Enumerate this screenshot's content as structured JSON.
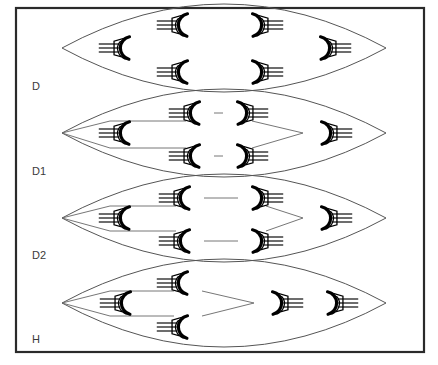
{
  "figure": {
    "title": "",
    "background": "#ffffff",
    "frame": {
      "x": 16,
      "y": 8,
      "width": 408,
      "height": 344,
      "stroke": "#2a2a2a"
    },
    "colors": {
      "frame": "#2a2a2a",
      "lens": "#555555",
      "link": "#666666",
      "node_outline": "#000000",
      "node_fill": "#ffffff",
      "label": "#3a3a3a"
    }
  },
  "rows": [
    {
      "id": "row-d",
      "label": "D",
      "label_x": 32,
      "label_y": 90,
      "lens": {
        "cx": 224,
        "cy": 48,
        "half_width": 162,
        "half_height": 44
      },
      "nodes": [
        {
          "name": "node-d-left",
          "x": 130,
          "y": 48,
          "dir": "left"
        },
        {
          "name": "node-d-upper-inner",
          "x": 188,
          "y": 25,
          "dir": "left"
        },
        {
          "name": "node-d-upper-outer",
          "x": 252,
          "y": 25,
          "dir": "right"
        },
        {
          "name": "node-d-right",
          "x": 320,
          "y": 48,
          "dir": "right"
        },
        {
          "name": "node-d-lower-inner",
          "x": 188,
          "y": 72,
          "dir": "left"
        },
        {
          "name": "node-d-lower-outer",
          "x": 252,
          "y": 72,
          "dir": "right"
        }
      ],
      "links": []
    },
    {
      "id": "row-d1",
      "label": "D1",
      "label_x": 32,
      "label_y": 175,
      "lens": {
        "cx": 224,
        "cy": 133,
        "half_width": 162,
        "half_height": 44
      },
      "nodes": [
        {
          "name": "node-d1-left",
          "x": 130,
          "y": 133,
          "dir": "left"
        },
        {
          "name": "node-d1-upper-inner",
          "x": 200,
          "y": 113,
          "dir": "left"
        },
        {
          "name": "node-d1-upper-outer",
          "x": 237,
          "y": 113,
          "dir": "right"
        },
        {
          "name": "node-d1-lower-inner",
          "x": 200,
          "y": 156,
          "dir": "left"
        },
        {
          "name": "node-d1-lower-outer",
          "x": 237,
          "y": 156,
          "dir": "right"
        },
        {
          "name": "node-d1-right",
          "x": 321,
          "y": 133,
          "dir": "right"
        }
      ],
      "links": [
        {
          "name": "link-d1-upper-apex",
          "points": "62,133 110,121 186,121"
        },
        {
          "name": "link-d1-lower-apex",
          "points": "62,133 110,148 186,148"
        },
        {
          "name": "link-d1-upper-right",
          "points": "252,121 303,133"
        },
        {
          "name": "link-d1-lower-right",
          "points": "252,148 303,133"
        },
        {
          "name": "link-d1-pair-upper",
          "points": "214,113 223,113"
        },
        {
          "name": "link-d1-pair-lower",
          "points": "214,156 223,156"
        }
      ]
    },
    {
      "id": "row-d2",
      "label": "D2",
      "label_x": 32,
      "label_y": 259,
      "lens": {
        "cx": 224,
        "cy": 218,
        "half_width": 162,
        "half_height": 44
      },
      "nodes": [
        {
          "name": "node-d2-left",
          "x": 130,
          "y": 218,
          "dir": "left"
        },
        {
          "name": "node-d2-upper-inner",
          "x": 190,
          "y": 198,
          "dir": "left"
        },
        {
          "name": "node-d2-upper-outer",
          "x": 252,
          "y": 198,
          "dir": "right"
        },
        {
          "name": "node-d2-lower-inner",
          "x": 190,
          "y": 241,
          "dir": "left"
        },
        {
          "name": "node-d2-lower-outer",
          "x": 252,
          "y": 241,
          "dir": "right"
        },
        {
          "name": "node-d2-right",
          "x": 321,
          "y": 218,
          "dir": "right"
        }
      ],
      "links": [
        {
          "name": "link-d2-upper-apex",
          "points": "62,218 110,206 176,206"
        },
        {
          "name": "link-d2-lower-apex",
          "points": "62,218 110,231 176,231"
        },
        {
          "name": "link-d2-pair-upper",
          "points": "204,198 238,198"
        },
        {
          "name": "link-d2-pair-lower",
          "points": "204,241 238,241"
        },
        {
          "name": "link-d2-upper-right",
          "points": "266,206 303,218"
        },
        {
          "name": "link-d2-lower-right",
          "points": "266,231 303,218"
        }
      ]
    },
    {
      "id": "row-h",
      "label": "H",
      "label_x": 32,
      "label_y": 343,
      "lens": {
        "cx": 224,
        "cy": 303,
        "half_width": 162,
        "half_height": 44
      },
      "nodes": [
        {
          "name": "node-h-left",
          "x": 131,
          "y": 303,
          "dir": "left"
        },
        {
          "name": "node-h-upper",
          "x": 188,
          "y": 283,
          "dir": "left"
        },
        {
          "name": "node-h-lower",
          "x": 188,
          "y": 327,
          "dir": "left"
        },
        {
          "name": "node-h-middle",
          "x": 272,
          "y": 303,
          "dir": "right"
        },
        {
          "name": "node-h-right",
          "x": 327,
          "y": 303,
          "dir": "right"
        }
      ],
      "links": [
        {
          "name": "link-h-upper-apex",
          "points": "62,303 110,291 174,291"
        },
        {
          "name": "link-h-lower-apex",
          "points": "62,303 110,316 174,316"
        },
        {
          "name": "link-h-upper-merge",
          "points": "202,291 254,303"
        },
        {
          "name": "link-h-lower-merge",
          "points": "202,316 254,303"
        }
      ]
    }
  ],
  "node_glyph": {
    "radius": 11,
    "tail_count": 3,
    "tail_length": 20,
    "tail_spacing": 4,
    "description": "hexagonal node with three parallel tail lines"
  }
}
